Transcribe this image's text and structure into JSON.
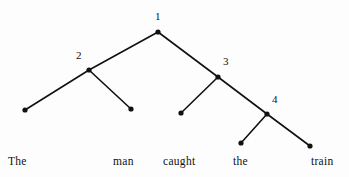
{
  "diagram": {
    "type": "parse-tree",
    "sentence": "The man caught the train",
    "background_color": "#fdfdfd",
    "stroke_color": "#111111",
    "dot_color": "#111111",
    "dot_radius": 2.6,
    "edge_width": 1.6,
    "canvas": {
      "width": 349,
      "height": 177
    },
    "internal_nodes": [
      {
        "id": "n1",
        "label": "1",
        "x": 158,
        "y": 32,
        "label_x": 155,
        "label_y": 11
      },
      {
        "id": "n2",
        "label": "2",
        "x": 89,
        "y": 70,
        "label_x": 76,
        "label_y": 50
      },
      {
        "id": "n3",
        "label": "3",
        "x": 218,
        "y": 77,
        "label_x": 223,
        "label_y": 56
      },
      {
        "id": "n4",
        "label": "4",
        "x": 267,
        "y": 114,
        "label_x": 272,
        "label_y": 94
      }
    ],
    "leaf_nodes": [
      {
        "id": "l1",
        "word": "The",
        "x": 25,
        "y": 110,
        "word_x": 8,
        "word_y": 155
      },
      {
        "id": "l2",
        "word": "man",
        "x": 131,
        "y": 109,
        "word_x": 113,
        "word_y": 155
      },
      {
        "id": "l3",
        "word": "caught",
        "x": 181,
        "y": 113,
        "word_x": 163,
        "word_y": 155
      },
      {
        "id": "l4",
        "word": "the",
        "x": 241,
        "y": 143,
        "word_x": 233,
        "word_y": 155
      },
      {
        "id": "l5",
        "word": "train",
        "x": 310,
        "y": 146,
        "word_x": 311,
        "word_y": 155
      }
    ],
    "edges": [
      {
        "from": "n1",
        "to": "n2",
        "x1": 158,
        "y1": 32,
        "x2": 89,
        "y2": 70
      },
      {
        "from": "n1",
        "to": "n3",
        "x1": 158,
        "y1": 32,
        "x2": 218,
        "y2": 77
      },
      {
        "from": "n2",
        "to": "l1",
        "x1": 89,
        "y1": 70,
        "x2": 25,
        "y2": 110
      },
      {
        "from": "n2",
        "to": "l2",
        "x1": 89,
        "y1": 70,
        "x2": 131,
        "y2": 109
      },
      {
        "from": "n3",
        "to": "l3",
        "x1": 218,
        "y1": 77,
        "x2": 181,
        "y2": 113
      },
      {
        "from": "n3",
        "to": "n4",
        "x1": 218,
        "y1": 77,
        "x2": 267,
        "y2": 114
      },
      {
        "from": "n4",
        "to": "l4",
        "x1": 267,
        "y1": 114,
        "x2": 241,
        "y2": 143
      },
      {
        "from": "n4",
        "to": "l5",
        "x1": 267,
        "y1": 114,
        "x2": 310,
        "y2": 146
      }
    ]
  }
}
